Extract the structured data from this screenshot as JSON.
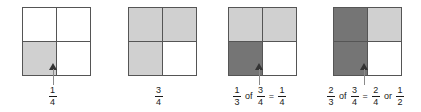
{
  "figure": {
    "colors": {
      "shade_light": "#d0d0d0",
      "shade_dark": "#757575",
      "unshaded": "#ffffff",
      "border": "#555555",
      "arrow_head": "#333333",
      "arrow_stem": "#8a8a8a",
      "text": "#1a1a1a"
    }
  },
  "panels": [
    {
      "id": "panel-1",
      "left": 0,
      "square_left": 22,
      "cells": {
        "top_left": "none",
        "top_right": "none",
        "bottom_left": "light",
        "bottom_right": "none"
      },
      "pointer": {
        "visible": true,
        "left": 49,
        "top": 63
      },
      "caption": {
        "tokens": [
          {
            "type": "fraction",
            "numerator": "1",
            "denominator": "4"
          }
        ]
      }
    },
    {
      "id": "panel-2",
      "left": 106,
      "square_left": 22,
      "cells": {
        "top_left": "light",
        "top_right": "light",
        "bottom_left": "light",
        "bottom_right": "none"
      },
      "pointer": {
        "visible": false,
        "left": 49,
        "top": 63
      },
      "caption": {
        "tokens": [
          {
            "type": "fraction",
            "numerator": "3",
            "denominator": "4"
          }
        ]
      }
    },
    {
      "id": "panel-3",
      "left": 207,
      "square_left": 21,
      "cells": {
        "top_left": "light",
        "top_right": "light",
        "bottom_left": "dark",
        "bottom_right": "none"
      },
      "pointer": {
        "visible": true,
        "left": 48,
        "top": 63
      },
      "caption": {
        "tokens": [
          {
            "type": "fraction",
            "numerator": "1",
            "denominator": "3"
          },
          {
            "type": "operator",
            "text": "of"
          },
          {
            "type": "fraction",
            "numerator": "3",
            "denominator": "4"
          },
          {
            "type": "operator",
            "text": "="
          },
          {
            "type": "fraction",
            "numerator": "1",
            "denominator": "4"
          }
        ]
      }
    },
    {
      "id": "panel-4",
      "left": 313,
      "square_left": 20,
      "cells": {
        "top_left": "dark",
        "top_right": "light",
        "bottom_left": "dark",
        "bottom_right": "none"
      },
      "pointer": {
        "visible": true,
        "left": 47,
        "top": 63
      },
      "caption": {
        "tokens": [
          {
            "type": "fraction",
            "numerator": "2",
            "denominator": "3"
          },
          {
            "type": "operator",
            "text": "of"
          },
          {
            "type": "fraction",
            "numerator": "3",
            "denominator": "4"
          },
          {
            "type": "operator",
            "text": "="
          },
          {
            "type": "fraction",
            "numerator": "2",
            "denominator": "4"
          },
          {
            "type": "operator",
            "text": "or"
          },
          {
            "type": "fraction",
            "numerator": "1",
            "denominator": "2"
          }
        ]
      }
    }
  ]
}
